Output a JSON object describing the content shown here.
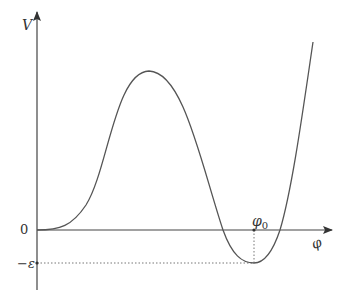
{
  "diagram": {
    "type": "potential-energy-curve",
    "axes": {
      "y_label": "V",
      "x_label": "φ",
      "origin_label": "0"
    },
    "annotations": {
      "minimum_x_label": "φ",
      "minimum_x_subscript": "0",
      "minimum_y_label": "−ε"
    },
    "colors": {
      "axis": "#444444",
      "curve": "#555555",
      "guide": "#777777",
      "text": "#333333"
    }
  }
}
